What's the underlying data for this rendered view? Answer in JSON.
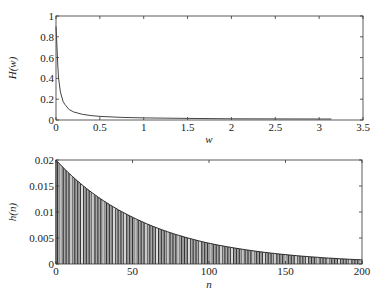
{
  "chart_data": [
    {
      "type": "line",
      "title": "",
      "xlabel": "w",
      "ylabel": "H(w)",
      "xlim": [
        0,
        3.5
      ],
      "ylim": [
        0,
        1
      ],
      "xticks": [
        "0",
        "0.5",
        "1",
        "1.5",
        "2",
        "2.5",
        "3",
        "3.5"
      ],
      "yticks": [
        "0",
        "0.2",
        "0.4",
        "0.6",
        "0.8",
        "1"
      ],
      "grid": false,
      "series": [
        {
          "name": "H(w)",
          "x": [
            0,
            0.01,
            0.02,
            0.03,
            0.05,
            0.08,
            0.1,
            0.15,
            0.2,
            0.3,
            0.4,
            0.5,
            0.75,
            1.0,
            1.5,
            2.0,
            2.5,
            3.0,
            3.14
          ],
          "values": [
            0.9,
            0.72,
            0.52,
            0.4,
            0.27,
            0.18,
            0.15,
            0.1,
            0.078,
            0.055,
            0.042,
            0.035,
            0.025,
            0.02,
            0.015,
            0.012,
            0.011,
            0.01,
            0.01
          ]
        }
      ]
    },
    {
      "type": "bar",
      "title": "",
      "xlabel": "n",
      "ylabel": "h(n)",
      "xlim": [
        0,
        200
      ],
      "ylim": [
        0,
        0.02
      ],
      "xticks": [
        "0",
        "50",
        "100",
        "150",
        "200"
      ],
      "yticks": [
        "0",
        "0.005",
        "0.01",
        "0.015",
        "0.02"
      ],
      "grid": false,
      "series": [
        {
          "name": "h(n)",
          "x": [
            0,
            25,
            50,
            75,
            100,
            125,
            150,
            175,
            200
          ],
          "values": [
            0.02,
            0.0134,
            0.009,
            0.006,
            0.004,
            0.0027,
            0.0018,
            0.0012,
            0.0008
          ]
        }
      ]
    }
  ],
  "plots": {
    "top": {
      "ylabel": "H(w)",
      "xlabel": "w"
    },
    "bottom": {
      "ylabel": "h(n)",
      "xlabel": "n"
    }
  }
}
